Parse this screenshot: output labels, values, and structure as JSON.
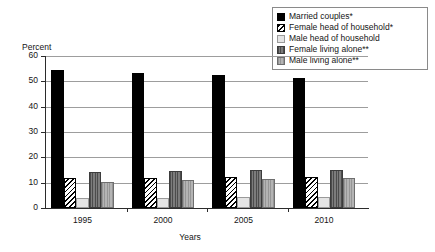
{
  "chart_data": {
    "type": "bar",
    "title": "",
    "xlabel": "Years",
    "ylabel": "Percent",
    "categories": [
      "1995",
      "2000",
      "2005",
      "2010"
    ],
    "ylim": [
      0,
      60
    ],
    "yticks": [
      0,
      10,
      20,
      30,
      40,
      50,
      60
    ],
    "grid": true,
    "legend_position": "top-right",
    "series": [
      {
        "name": "Married couples*",
        "key": "married",
        "fill": "solid-black",
        "color": "#000000",
        "values": [
          54.5,
          53.3,
          52.4,
          51.5
        ]
      },
      {
        "name": "Female head of household*",
        "key": "female-head",
        "fill": "diagonal-hatch",
        "color": "#ffffff",
        "values": [
          11.8,
          11.8,
          12.3,
          12.4
        ]
      },
      {
        "name": "Male head of household",
        "key": "male-head",
        "fill": "light-gray",
        "color": "#e4e4e4",
        "values": [
          3.8,
          3.8,
          4.3,
          4.3
        ]
      },
      {
        "name": "Female living alone**",
        "key": "female-alone",
        "fill": "dark-gray-vertical",
        "color": "#6d6d6d",
        "values": [
          14.4,
          14.8,
          14.9,
          15.2
        ]
      },
      {
        "name": "Male living alone**",
        "key": "male-alone",
        "fill": "medium-gray-vertical",
        "color": "#a8a8a8",
        "values": [
          10.4,
          10.9,
          11.4,
          11.8
        ]
      }
    ]
  },
  "axis": {
    "y_title": "Percent",
    "x_title": "Years",
    "y_tick_labels": [
      "60",
      "50",
      "40",
      "30",
      "20",
      "10",
      "0"
    ],
    "x_tick_labels": [
      "1995",
      "2000",
      "2005",
      "2010"
    ]
  },
  "legend": {
    "items": [
      {
        "label": "Married couples*"
      },
      {
        "label": "Female head of household*"
      },
      {
        "label": "Male head of household"
      },
      {
        "label": "Female living alone**"
      },
      {
        "label": "Male living alone**"
      }
    ]
  }
}
